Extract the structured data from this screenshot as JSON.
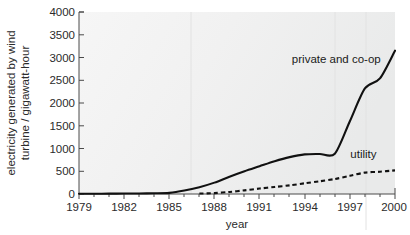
{
  "chart_data": {
    "type": "line",
    "title": "",
    "xlabel": "year",
    "ylabel": "electricity generated by wind turbine / gigawatt-hour",
    "ylabel_line1": "electricity generated by wind",
    "ylabel_line2": "turbine / gigawatt-hour",
    "xlim": [
      1979,
      2000
    ],
    "ylim": [
      0,
      4000
    ],
    "grid": false,
    "legend_position": "inline-annotation",
    "x_tick_labels": [
      "1979",
      "1982",
      "1985",
      "1988",
      "1991",
      "1994",
      "1997",
      "2000"
    ],
    "x_tick_values": [
      1979,
      1982,
      1985,
      1988,
      1991,
      1994,
      1997,
      2000
    ],
    "x_minor_tick_values": [
      1980,
      1981,
      1983,
      1984,
      1986,
      1987,
      1989,
      1990,
      1992,
      1993,
      1995,
      1996,
      1998,
      1999
    ],
    "y_tick_labels": [
      "0",
      "500",
      "1000",
      "1500",
      "2000",
      "2500",
      "3000",
      "3500",
      "4000"
    ],
    "y_tick_values": [
      0,
      500,
      1000,
      1500,
      2000,
      2500,
      3000,
      3500,
      4000
    ],
    "series": [
      {
        "name": "private and co-op",
        "style": "solid",
        "label": "private and co-op",
        "x": [
          1979,
          1980,
          1981,
          1982,
          1983,
          1984,
          1985,
          1986,
          1987,
          1988,
          1989,
          1990,
          1991,
          1992,
          1993,
          1994,
          1995,
          1996,
          1997,
          1998,
          1999,
          2000
        ],
        "values": [
          5,
          5,
          8,
          10,
          12,
          15,
          25,
          75,
          150,
          250,
          380,
          500,
          610,
          720,
          810,
          870,
          880,
          885,
          1600,
          2320,
          2540,
          3150
        ]
      },
      {
        "name": "utility",
        "style": "dashed",
        "label": "utility",
        "x": [
          1987,
          1988,
          1989,
          1990,
          1991,
          1992,
          1993,
          1994,
          1995,
          1996,
          1997,
          1998,
          1999,
          2000
        ],
        "values": [
          10,
          20,
          45,
          80,
          120,
          155,
          190,
          235,
          280,
          330,
          400,
          470,
          490,
          520
        ]
      }
    ],
    "annotations": [
      {
        "text": "private and co-op",
        "x": 1996.1,
        "y": 2880
      },
      {
        "text": "utility",
        "x": 1997.9,
        "y": 790
      }
    ],
    "colors": {
      "series": "#111111",
      "axis": "#4a4a4a",
      "text": "#2b2b2b",
      "plot_background": "#f1f1f1"
    }
  },
  "axis_titles": {
    "x": "year"
  }
}
